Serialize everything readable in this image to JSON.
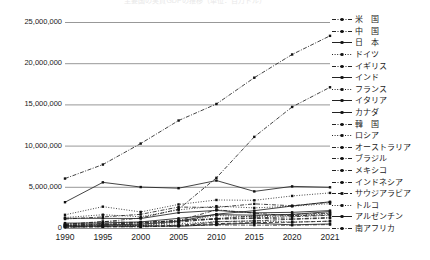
{
  "chart_data": {
    "type": "line",
    "title": "主要国の実質GDPの推移（単位：百万ドル）",
    "xlabel": "",
    "ylabel": "",
    "x": [
      1990,
      1995,
      2000,
      2005,
      2010,
      2015,
      2020,
      2021
    ],
    "xtick_labels": [
      "1990",
      "1995",
      "2000",
      "2005",
      "2010",
      "2015",
      "2020",
      "2021"
    ],
    "ylim": [
      0,
      25000000
    ],
    "ytick_values": [
      25000000,
      20000000,
      15000000,
      10000000,
      5000000,
      0
    ],
    "ytick_labels": [
      "25,000,000",
      "20,000,000",
      "15,000,000",
      "10,000,000",
      "5,000,000",
      "0"
    ],
    "grid": true,
    "legend_position": "right",
    "series": [
      {
        "name": "米　国",
        "dash": "dashdot",
        "values": [
          6000000,
          7700000,
          10250000,
          13040000,
          15050000,
          18240000,
          21060000,
          23320000
        ]
      },
      {
        "name": "中　国",
        "dash": "dashdot",
        "values": [
          400000,
          750000,
          1210000,
          2290000,
          6090000,
          11060000,
          14690000,
          17080000
        ]
      },
      {
        "name": "日　本",
        "dash": "solid",
        "values": [
          3130000,
          5540000,
          4970000,
          4830000,
          5760000,
          4440000,
          5050000,
          4940000
        ]
      },
      {
        "name": "ドイツ",
        "dash": "dotted",
        "values": [
          1600000,
          2590000,
          1950000,
          2860000,
          3400000,
          3360000,
          3890000,
          4260000
        ]
      },
      {
        "name": "イギリス",
        "dash": "dashdot",
        "values": [
          1090000,
          1340000,
          1660000,
          2540000,
          2490000,
          2930000,
          2700000,
          3130000
        ]
      },
      {
        "name": "インド",
        "dash": "solid",
        "values": [
          320000,
          360000,
          470000,
          820000,
          1680000,
          2100000,
          2670000,
          3180000
        ]
      },
      {
        "name": "フランス",
        "dash": "dotted",
        "values": [
          1270000,
          1610000,
          1370000,
          2200000,
          2650000,
          2440000,
          2640000,
          2960000
        ]
      },
      {
        "name": "イタリア",
        "dash": "solid",
        "values": [
          1180000,
          1170000,
          1150000,
          1860000,
          2130000,
          1840000,
          1900000,
          2110000
        ]
      },
      {
        "name": "カナダ",
        "dash": "solid",
        "values": [
          596000,
          604000,
          742000,
          1170000,
          1620000,
          1560000,
          1650000,
          1990000
        ]
      },
      {
        "name": "韓　国",
        "dash": "dashdot",
        "values": [
          283000,
          566000,
          576000,
          935000,
          1140000,
          1470000,
          1640000,
          1810000
        ]
      },
      {
        "name": "ロシア",
        "dash": "dotted",
        "values": [
          517000,
          396000,
          260000,
          764000,
          1520000,
          1360000,
          1490000,
          1780000
        ]
      },
      {
        "name": "オーストラリア",
        "dash": "dashdot",
        "values": [
          311000,
          371000,
          416000,
          693000,
          1150000,
          1230000,
          1360000,
          1550000
        ]
      },
      {
        "name": "ブラジル",
        "dash": "dashdot",
        "values": [
          455000,
          786000,
          655000,
          892000,
          2210000,
          1800000,
          1470000,
          1610000
        ]
      },
      {
        "name": "メキシコ",
        "dash": "dashdot",
        "values": [
          309000,
          360000,
          708000,
          877000,
          1060000,
          1170000,
          1090000,
          1290000
        ]
      },
      {
        "name": "インドネシア",
        "dash": "dashdot",
        "values": [
          114000,
          202000,
          165000,
          286000,
          755000,
          861000,
          1060000,
          1190000
        ]
      },
      {
        "name": "サウジアラビア",
        "dash": "dashed",
        "values": [
          118000,
          143000,
          190000,
          328000,
          528000,
          654000,
          703000,
          834000
        ]
      },
      {
        "name": "トルコ",
        "dash": "dotted",
        "values": [
          207000,
          170000,
          274000,
          506000,
          776000,
          864000,
          720000,
          819000
        ]
      },
      {
        "name": "アルゼンチン",
        "dash": "solid",
        "values": [
          141000,
          258000,
          284000,
          199000,
          426000,
          594000,
          385000,
          491000
        ]
      },
      {
        "name": "南アフリカ",
        "dash": "dashdot",
        "values": [
          115000,
          151000,
          136000,
          257000,
          375000,
          346000,
          338000,
          419000
        ]
      }
    ]
  }
}
